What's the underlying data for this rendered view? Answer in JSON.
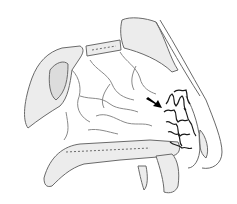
{
  "figure": {
    "annotation": "arrow pointing to vascular plexus",
    "colors": {
      "background": "#ffffff",
      "line": "#6a6a6a",
      "bone_fill": "#ececec",
      "dark_line": "#1a1a1a",
      "arrow": "#000000"
    }
  }
}
